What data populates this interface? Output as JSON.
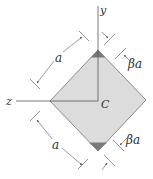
{
  "figure": {
    "axes": {
      "y_label": "y",
      "z_label": "z"
    },
    "centroid_label": "C",
    "dimensions": {
      "upper_side_label": "a",
      "lower_side_label": "a",
      "upper_cut_label": "βa",
      "lower_cut_label": "βa"
    },
    "colors": {
      "square_fill": "#dcdcdc",
      "square_edge": "#8a8a8a",
      "cut_fill": "#7a7a7a",
      "line": "#555555"
    }
  }
}
